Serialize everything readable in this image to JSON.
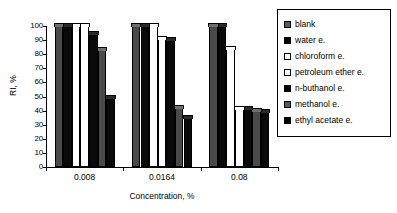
{
  "chart_data": {
    "type": "bar",
    "title": "",
    "xlabel": "Concentration, %",
    "ylabel": "RI, %",
    "categories": [
      "0.008",
      "0.0164",
      "0.08"
    ],
    "ylim": [
      0,
      100
    ],
    "yticks": [
      0,
      10,
      20,
      30,
      40,
      50,
      60,
      70,
      80,
      90,
      100
    ],
    "grid": false,
    "legend_position": "right",
    "series": [
      {
        "name": "blank",
        "fill": "gray",
        "values": [
          100,
          100,
          100
        ]
      },
      {
        "name": "water e.",
        "fill": "black",
        "values": [
          100,
          100,
          100
        ]
      },
      {
        "name": "chloroform e.",
        "fill": "white",
        "values": [
          100,
          100,
          84
        ]
      },
      {
        "name": "petroleum ether e.",
        "fill": "white",
        "values": [
          100,
          91,
          41
        ]
      },
      {
        "name": "n-buthanol e.",
        "fill": "black",
        "values": [
          94,
          90,
          41
        ]
      },
      {
        "name": "methanol e.",
        "fill": "gray",
        "values": [
          83,
          42,
          40
        ]
      },
      {
        "name": "ethyl acetate e.",
        "fill": "black",
        "values": [
          49,
          35,
          39
        ]
      }
    ]
  },
  "legend": {
    "items": [
      {
        "label": "blank",
        "fill": "gray"
      },
      {
        "label": "water e.",
        "fill": "black"
      },
      {
        "label": "chloroform e.",
        "fill": "white"
      },
      {
        "label": "petroleum ether e.",
        "fill": "white"
      },
      {
        "label": "n-buthanol e.",
        "fill": "black"
      },
      {
        "label": "methanol e.",
        "fill": "gray"
      },
      {
        "label": "ethyl acetate e.",
        "fill": "black"
      }
    ]
  },
  "colors": {
    "gray": "#4a4a4a",
    "black": "#0a0a0a",
    "white": "#ffffff",
    "axis": "#000000",
    "background": "#ffffff"
  }
}
